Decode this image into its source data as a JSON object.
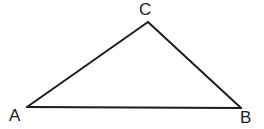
{
  "figure": {
    "kind": "geometry-diagram",
    "shape_name": "triangle",
    "background_color": "#ffffff",
    "stroke_color": "#1c1c1c",
    "stroke_width": 2,
    "canvas": {
      "width": 264,
      "height": 129
    },
    "vertices": [
      {
        "id": "A",
        "label": "A",
        "x": 27,
        "y": 107,
        "label_x": 9,
        "label_y": 107,
        "position": "bottom-left"
      },
      {
        "id": "B",
        "label": "B",
        "x": 241,
        "y": 108,
        "label_x": 240,
        "label_y": 109,
        "position": "bottom-right"
      },
      {
        "id": "C",
        "label": "C",
        "x": 148,
        "y": 22,
        "label_x": 139,
        "label_y": 1,
        "position": "apex-top"
      }
    ],
    "edges": [
      {
        "id": "AC",
        "from": "A",
        "to": "C"
      },
      {
        "id": "CB",
        "from": "C",
        "to": "B"
      },
      {
        "id": "BA",
        "from": "B",
        "to": "A"
      }
    ],
    "polygon_points": "27,107 148,22 241,108"
  }
}
